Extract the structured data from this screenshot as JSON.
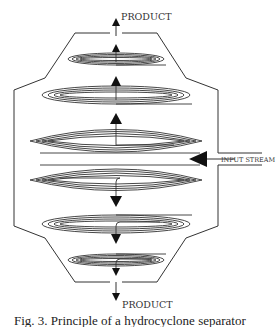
{
  "diagram": {
    "labels": {
      "top_outlet": "PRODUCT",
      "bottom_outlet": "PRODUCT",
      "inlet": "INPUT STREAM"
    },
    "caption": "Fig. 3. Principle of a hydrocyclone separator",
    "colors": {
      "line": "#333333",
      "background": "#ffffff"
    },
    "spirals": [
      {
        "id": "spiral-1",
        "flow": "up"
      },
      {
        "id": "spiral-2",
        "flow": "up"
      },
      {
        "id": "spiral-3",
        "flow": "up"
      },
      {
        "id": "spiral-4",
        "flow": "down"
      },
      {
        "id": "spiral-5",
        "flow": "down"
      },
      {
        "id": "spiral-6",
        "flow": "down"
      }
    ]
  }
}
